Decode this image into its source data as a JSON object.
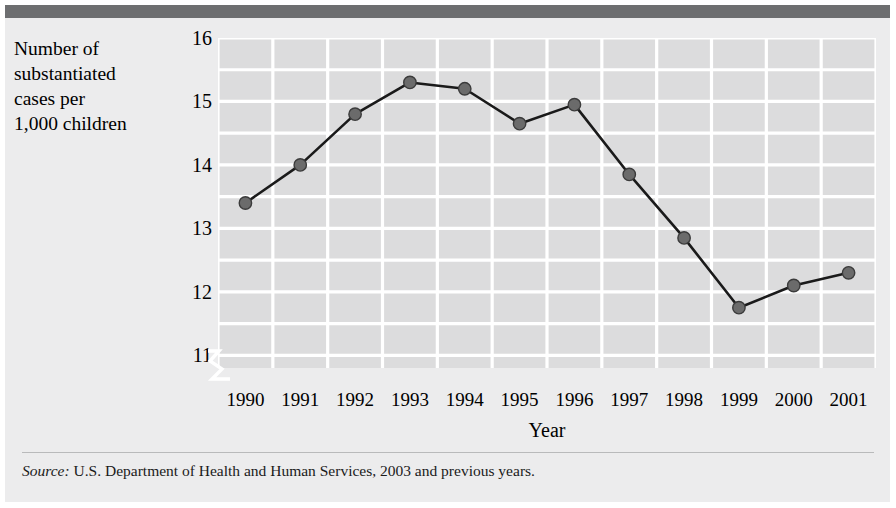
{
  "figure": {
    "y_axis_caption": "Number of\nsubstantiated\ncases per\n1,000 children",
    "x_axis_title": "Year",
    "source_label": "Source:",
    "source_text": " U.S. Department of Health and Human Services, 2003 and previous years."
  },
  "colors": {
    "page_background": "#ffffff",
    "panel_background": "#ececed",
    "top_rule": "#6d6e70",
    "plot_background": "#dcdcdd",
    "gridline": "#ffffff",
    "line": "#1a1a1a",
    "marker_fill": "#6b6b6b",
    "marker_edge": "#3b3b3b",
    "text": "#000000"
  },
  "chart_data": {
    "type": "line",
    "title": "",
    "xlabel": "Year",
    "ylabel": "Number of substantiated cases per 1,000 children",
    "categories": [
      "1990",
      "1991",
      "1992",
      "1993",
      "1994",
      "1995",
      "1996",
      "1997",
      "1998",
      "1999",
      "2000",
      "2001"
    ],
    "x": [
      1990,
      1991,
      1992,
      1993,
      1994,
      1995,
      1996,
      1997,
      1998,
      1999,
      2000,
      2001
    ],
    "values": [
      13.4,
      14.0,
      14.8,
      15.3,
      15.2,
      14.65,
      14.95,
      13.85,
      12.85,
      11.75,
      12.1,
      12.3
    ],
    "series": [
      {
        "name": "Substantiated cases per 1,000 children",
        "values": [
          13.4,
          14.0,
          14.8,
          15.3,
          15.2,
          14.65,
          14.95,
          13.85,
          12.85,
          11.75,
          12.1,
          12.3
        ]
      }
    ],
    "ylim": [
      10.8,
      16.0
    ],
    "xlim": [
      1989.5,
      2001.5
    ],
    "ytick_labels": [
      "16",
      "15",
      "14",
      "13",
      "12",
      "11"
    ],
    "ytick_values": [
      16,
      15,
      14,
      13,
      12,
      11
    ],
    "minor_y_step": 0.5,
    "grid": true,
    "grid_color": "#ffffff",
    "legend": "none",
    "axis_break": true,
    "axis_break_note": "y-axis broken below 11",
    "marker": "circle"
  }
}
